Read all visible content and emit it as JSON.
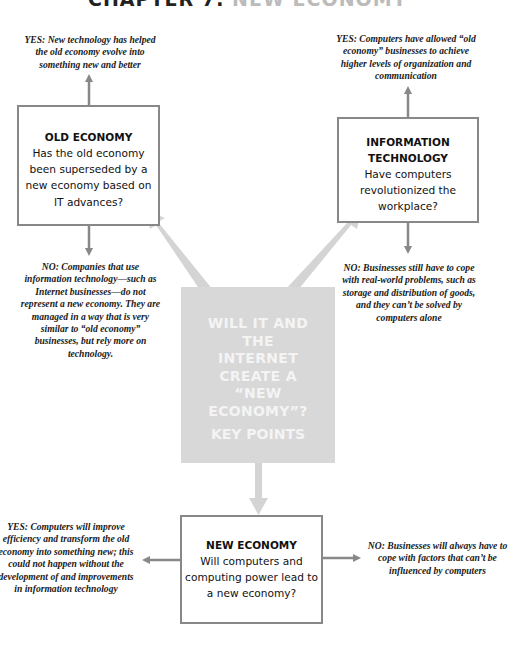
{
  "title": {
    "dark": "CHAPTER 7:",
    "light": "NEW ECONOMY"
  },
  "center": {
    "lines": [
      "WILL IT AND",
      "THE",
      "INTERNET",
      "CREATE A",
      "“NEW",
      "ECONOMY”?"
    ],
    "key_points": "KEY POINTS"
  },
  "old_economy": {
    "heading": "OLD ECONOMY",
    "question_lines": [
      "Has the old economy",
      "been superseded by a",
      "new economy based on",
      "IT advances?"
    ],
    "yes": "YES: New technology has helped the old economy evolve into something new and better",
    "no": "NO: Companies that use information technology—such as Internet businesses—do not represent a new economy. They are managed in a way that is very similar to “old economy” businesses, but rely more on technology."
  },
  "information_technology": {
    "heading_lines": [
      "INFORMATION",
      "TECHNOLOGY"
    ],
    "question_lines": [
      "Have computers",
      "revolutionized the",
      "workplace?"
    ],
    "yes": "YES: Computers have allowed “old economy” businesses to achieve higher levels of organization and communication",
    "no": "NO: Businesses still have to cope with real-world problems, such as storage and distribution of goods, and they can’t be solved by computers alone"
  },
  "new_economy": {
    "heading": "NEW ECONOMY",
    "question_lines": [
      "Will computers and",
      "computing power lead to",
      "a new economy?"
    ],
    "yes": "YES: Computers will improve efficiency and transform the old economy into something new; this could not happen without the development of and improvements in information technology",
    "no": "NO: Businesses will always have to cope with factors that can’t be influenced by computers"
  },
  "colors": {
    "box_border": "#888888",
    "center_fill": "#d8d8d8",
    "arrow_gray": "#888888",
    "arrow_light": "#d4d4d4"
  }
}
